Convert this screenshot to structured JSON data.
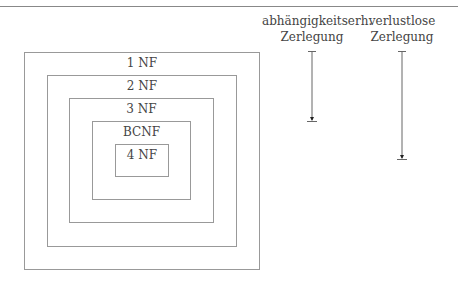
{
  "diagram": {
    "normal_forms": [
      {
        "label": "1 NF"
      },
      {
        "label": "2 NF"
      },
      {
        "label": "3 NF"
      },
      {
        "label": "BCNF"
      },
      {
        "label": "4 NF"
      }
    ],
    "columns": [
      {
        "line1": "abhängigkeitserh.",
        "line2": "Zerlegung"
      },
      {
        "line1": "verlustlose",
        "line2": "Zerlegung"
      }
    ]
  }
}
